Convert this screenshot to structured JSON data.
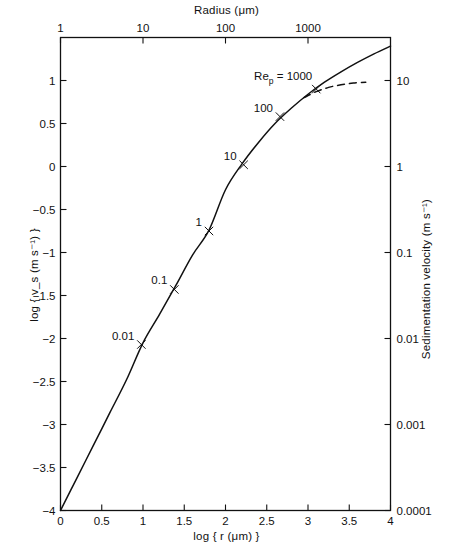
{
  "figure": {
    "background": "#ffffff",
    "line_color": "#111111"
  },
  "axes": {
    "top": {
      "title_prefix": "Radius (",
      "title_mu": "μ",
      "title_suffix": "m)",
      "title": "Radius (μm)",
      "ticks": [
        {
          "label": "1",
          "value": 0
        },
        {
          "label": "10",
          "value": 1
        },
        {
          "label": "100",
          "value": 2
        },
        {
          "label": "1000",
          "value": 3
        }
      ]
    },
    "bottom": {
      "title": "log { r (μm) }",
      "title_log": "log",
      "title_brace_open": "{",
      "title_r": "r",
      "title_paren_open": "(",
      "title_mu": "μ",
      "title_m": "m)",
      "title_brace_close": "}",
      "ticks": [
        {
          "label": "0",
          "value": 0
        },
        {
          "label": "0.5",
          "value": 0.5
        },
        {
          "label": "1",
          "value": 1
        },
        {
          "label": "1.5",
          "value": 1.5
        },
        {
          "label": "2",
          "value": 2
        },
        {
          "label": "2.5",
          "value": 2.5
        },
        {
          "label": "3",
          "value": 3
        },
        {
          "label": "3.5",
          "value": 3.5
        },
        {
          "label": "4",
          "value": 4
        }
      ]
    },
    "left": {
      "title_log": "log",
      "title_brace_open": "{",
      "title_v": "v",
      "title_v_sub": "s",
      "title_units": "(m s",
      "title_exp": "−1",
      "title_units_close": ")",
      "title_brace_close": "}",
      "title": "log { v_s (m s⁻¹) }",
      "ticks": [
        {
          "label": "1",
          "value": 1
        },
        {
          "label": "0.5",
          "value": 0.5
        },
        {
          "label": "0",
          "value": 0
        },
        {
          "label": "−0.5",
          "value": -0.5
        },
        {
          "label": "−1",
          "value": -1
        },
        {
          "label": "−1.5",
          "value": -1.5
        },
        {
          "label": "−2",
          "value": -2
        },
        {
          "label": "−2.5",
          "value": -2.5
        },
        {
          "label": "−3",
          "value": -3
        },
        {
          "label": "−3.5",
          "value": -3.5
        },
        {
          "label": "−4",
          "value": -4
        }
      ]
    },
    "right": {
      "title_main": "Sedimentation velocity (m s",
      "title_exp": "−1",
      "title_close": ")",
      "title": "Sedimentation velocity (m s⁻¹)",
      "ticks": [
        {
          "label": "10",
          "value": 1
        },
        {
          "label": "1",
          "value": 0
        },
        {
          "label": "0.1",
          "value": -1
        },
        {
          "label": "0.01",
          "value": -2
        },
        {
          "label": "0.001",
          "value": -3
        },
        {
          "label": "0.0001",
          "value": -4
        }
      ]
    }
  },
  "annotations": {
    "reynolds_marks": [
      {
        "label": "0.01",
        "x": 0.98,
        "y": -2.07
      },
      {
        "label": "0.1",
        "x": 1.38,
        "y": -1.43
      },
      {
        "label": "1",
        "x": 1.8,
        "y": -0.75
      },
      {
        "label": "10",
        "x": 2.22,
        "y": 0.02
      },
      {
        "label": "100",
        "x": 2.66,
        "y": 0.58
      },
      {
        "label": "1000",
        "x": 3.1,
        "y": 0.9
      }
    ],
    "reynolds_title": {
      "prefix": "Re",
      "subscript": "p",
      "equals": " = 1000",
      "text": "Re_p = 1000"
    }
  },
  "chart_data": {
    "type": "line",
    "title": "",
    "xlabel": "log { r (μm) }",
    "ylabel": "log { v_s (m s⁻¹) }",
    "xlim": [
      0,
      4
    ],
    "ylim": [
      -4,
      1.5
    ],
    "grid": false,
    "legend": "none",
    "secondary_xaxis": {
      "label": "Radius (μm)",
      "ticks": [
        1,
        10,
        100,
        1000
      ],
      "tick_positions": [
        0,
        1,
        2,
        3
      ]
    },
    "secondary_yaxis": {
      "label": "Sedimentation velocity (m s⁻¹)",
      "ticks": [
        10,
        1,
        0.1,
        0.01,
        0.001,
        0.0001
      ],
      "tick_positions": [
        1,
        0,
        -1,
        -2,
        -3,
        -4
      ]
    },
    "series": [
      {
        "name": "sedimentation velocity (solid)",
        "style": "solid",
        "x": [
          0.0,
          0.2,
          0.4,
          0.6,
          0.8,
          1.0,
          1.2,
          1.4,
          1.6,
          1.8,
          2.0,
          2.2,
          2.4,
          2.6,
          2.8,
          3.0,
          3.2,
          3.4,
          3.6,
          3.8,
          4.0
        ],
        "y": [
          -4.0,
          -3.62,
          -3.24,
          -2.86,
          -2.48,
          -2.05,
          -1.72,
          -1.38,
          -1.03,
          -0.74,
          -0.27,
          0.03,
          0.28,
          0.5,
          0.68,
          0.84,
          0.98,
          1.1,
          1.21,
          1.31,
          1.4
        ]
      },
      {
        "name": "high Reynolds branch (dashed)",
        "style": "dashed",
        "x": [
          2.95,
          3.1,
          3.25,
          3.4,
          3.55,
          3.7
        ],
        "y": [
          0.8,
          0.87,
          0.92,
          0.95,
          0.97,
          0.98
        ]
      }
    ]
  }
}
